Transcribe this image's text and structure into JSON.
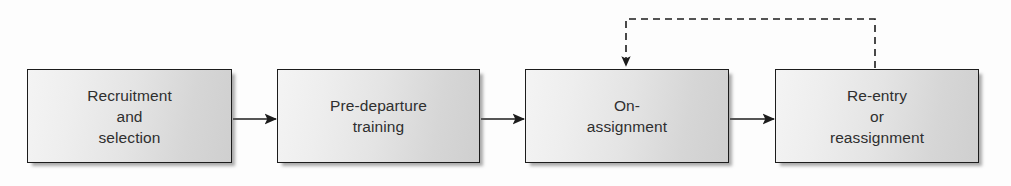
{
  "diagram": {
    "background_color": "#fdfdfd",
    "box_border_color": "#1c1c1c",
    "box_fill_light": "#f4f4f4",
    "box_fill_dark": "#cfcfcf",
    "text_color": "#2f2f2f",
    "connector_color": "#1c1c1c",
    "stages": [
      {
        "id": "recruitment-and-selection",
        "label": "Recruitment\nand\nselection",
        "x": 27,
        "y": 69,
        "width": 205,
        "height": 94
      },
      {
        "id": "pre-departure-training",
        "label": "Pre-departure\ntraining",
        "x": 277,
        "y": 69,
        "width": 203,
        "height": 94
      },
      {
        "id": "on-assignment",
        "label": "On-\nassignment",
        "x": 525,
        "y": 69,
        "width": 204,
        "height": 94
      },
      {
        "id": "re-entry-or-reassignment",
        "label": "Re-entry\nor\nreassignment",
        "x": 775,
        "y": 69,
        "width": 204,
        "height": 94
      }
    ],
    "connectors": [
      {
        "id": "recruitment-to-training",
        "style": "solid",
        "from": "recruitment-and-selection",
        "to": "pre-departure-training",
        "x1": 233,
        "y1": 119,
        "x2": 276,
        "y2": 119,
        "arrowhead": "end"
      },
      {
        "id": "training-to-assignment",
        "style": "solid",
        "from": "pre-departure-training",
        "to": "on-assignment",
        "x1": 481,
        "y1": 119,
        "x2": 524,
        "y2": 119,
        "arrowhead": "end"
      },
      {
        "id": "assignment-to-reentry",
        "style": "solid",
        "from": "on-assignment",
        "to": "re-entry-or-reassignment",
        "x1": 730,
        "y1": 119,
        "x2": 774,
        "y2": 119,
        "arrowhead": "end"
      },
      {
        "id": "reentry-feedback-to-assignment",
        "style": "dashed",
        "from": "re-entry-or-reassignment",
        "to": "on-assignment",
        "path": "M 875 68 L 875 19 L 626 19 L 626 66",
        "dash_pattern": "7 5",
        "arrowhead": "end"
      }
    ]
  }
}
